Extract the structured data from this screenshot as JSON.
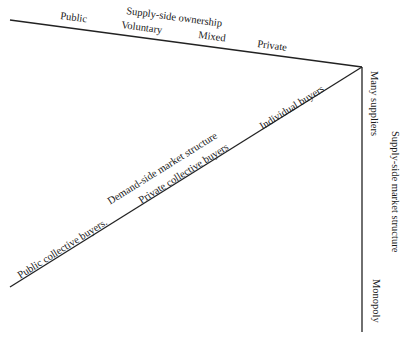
{
  "diagram": {
    "top_axis": {
      "title": "Supply-side ownership",
      "labels": [
        "Public",
        "Voluntary",
        "Mixed",
        "Private"
      ]
    },
    "diagonal_axis": {
      "title": "Demand-side market structure",
      "labels": [
        "Public collective buyers.",
        "Private collective buyers",
        "Individual buyers"
      ]
    },
    "vertical_axis": {
      "title": "Supply-side market structure",
      "labels": [
        "Many suppliers",
        "Monopoly"
      ]
    },
    "line_color": "#222222"
  }
}
